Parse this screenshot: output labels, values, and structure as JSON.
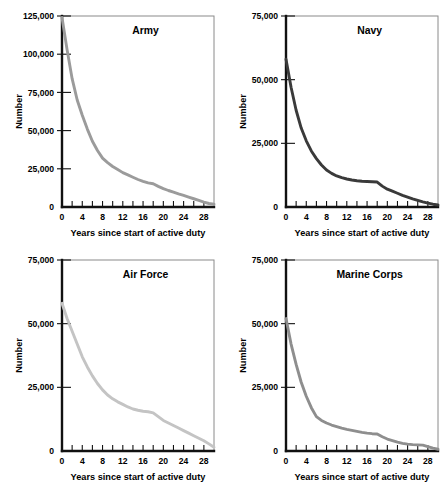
{
  "figure": {
    "name": "military-active-duty-retention-panels",
    "background": "#ffffff",
    "layout": "2x2 grid of small-multiple line charts"
  },
  "chart_data": [
    {
      "type": "line",
      "title": "Army",
      "xlabel": "Years since start of active duty",
      "ylabel": "Number",
      "xlim": [
        0,
        30
      ],
      "ylim": [
        0,
        125000
      ],
      "xticks": [
        0,
        2,
        4,
        6,
        8,
        10,
        12,
        14,
        16,
        18,
        20,
        22,
        24,
        26,
        28
      ],
      "xticklabels": [
        "0",
        "",
        "4",
        "",
        "8",
        "",
        "12",
        "",
        "16",
        "",
        "20",
        "",
        "24",
        "",
        "28"
      ],
      "yticks": [
        0,
        25000,
        50000,
        75000,
        100000,
        125000
      ],
      "yticklabels": [
        "0",
        "25,000",
        "50,000",
        "75,000",
        "100,000",
        "125,000"
      ],
      "grid": false,
      "legend": "none",
      "line_color": "#9b9b9b",
      "x": [
        0,
        1,
        2,
        3,
        4,
        5,
        6,
        7,
        8,
        9,
        10,
        11,
        12,
        13,
        14,
        15,
        16,
        17,
        18,
        19,
        20,
        21,
        22,
        23,
        24,
        25,
        26,
        27,
        28,
        29,
        30
      ],
      "values": [
        124000,
        103000,
        84000,
        70000,
        60000,
        51000,
        43000,
        37000,
        32000,
        29000,
        26500,
        24500,
        22500,
        21000,
        19500,
        18000,
        16800,
        15800,
        15200,
        13500,
        12000,
        10800,
        9700,
        8600,
        7600,
        6500,
        5400,
        4300,
        3200,
        2300,
        1800
      ]
    },
    {
      "type": "line",
      "title": "Navy",
      "xlabel": "Years since start of active duty",
      "ylabel": "Number",
      "xlim": [
        0,
        30
      ],
      "ylim": [
        0,
        75000
      ],
      "xticks": [
        0,
        2,
        4,
        6,
        8,
        10,
        12,
        14,
        16,
        18,
        20,
        22,
        24,
        26,
        28
      ],
      "xticklabels": [
        "0",
        "",
        "4",
        "",
        "8",
        "",
        "12",
        "",
        "16",
        "",
        "20",
        "",
        "24",
        "",
        "28"
      ],
      "yticks": [
        0,
        25000,
        50000,
        75000
      ],
      "yticklabels": [
        "0",
        "25,000",
        "50,000",
        "75,000"
      ],
      "grid": false,
      "legend": "none",
      "line_color": "#3a3a3a",
      "x": [
        0,
        1,
        2,
        3,
        4,
        5,
        6,
        7,
        8,
        9,
        10,
        11,
        12,
        13,
        14,
        15,
        16,
        17,
        18,
        19,
        20,
        21,
        22,
        23,
        24,
        25,
        26,
        27,
        28,
        29,
        30
      ],
      "values": [
        58000,
        47000,
        38000,
        31000,
        26000,
        22000,
        19000,
        16500,
        14500,
        13200,
        12200,
        11500,
        11000,
        10600,
        10300,
        10100,
        10000,
        9900,
        9800,
        8200,
        7000,
        6200,
        5400,
        4600,
        3900,
        3200,
        2600,
        2000,
        1500,
        1100,
        800
      ]
    },
    {
      "type": "line",
      "title": "Air Force",
      "xlabel": "Years since start of active duty",
      "ylabel": "Number",
      "xlim": [
        0,
        30
      ],
      "ylim": [
        0,
        75000
      ],
      "xticks": [
        0,
        2,
        4,
        6,
        8,
        10,
        12,
        14,
        16,
        18,
        20,
        22,
        24,
        26,
        28
      ],
      "xticklabels": [
        "0",
        "",
        "4",
        "",
        "8",
        "",
        "12",
        "",
        "16",
        "",
        "20",
        "",
        "24",
        "",
        "28"
      ],
      "yticks": [
        0,
        25000,
        50000,
        75000
      ],
      "yticklabels": [
        "0",
        "25,000",
        "50,000",
        "75,000"
      ],
      "grid": false,
      "legend": "none",
      "line_color": "#c4c4c4",
      "x": [
        0,
        1,
        2,
        3,
        4,
        5,
        6,
        7,
        8,
        9,
        10,
        11,
        12,
        13,
        14,
        15,
        16,
        17,
        18,
        19,
        20,
        21,
        22,
        23,
        24,
        25,
        26,
        27,
        28,
        29,
        30
      ],
      "values": [
        58000,
        52000,
        47000,
        42000,
        37000,
        33000,
        29500,
        26500,
        24000,
        22000,
        20500,
        19300,
        18300,
        17300,
        16500,
        16000,
        15600,
        15400,
        15000,
        13500,
        12000,
        11000,
        10000,
        9000,
        8000,
        7000,
        6000,
        5000,
        4000,
        2800,
        1500
      ]
    },
    {
      "type": "line",
      "title": "Marine Corps",
      "xlabel": "Years since start of active duty",
      "ylabel": "Number",
      "xlim": [
        0,
        30
      ],
      "ylim": [
        0,
        75000
      ],
      "xticks": [
        0,
        2,
        4,
        6,
        8,
        10,
        12,
        14,
        16,
        18,
        20,
        22,
        24,
        26,
        28
      ],
      "xticklabels": [
        "0",
        "",
        "4",
        "",
        "8",
        "",
        "12",
        "",
        "16",
        "",
        "20",
        "",
        "24",
        "",
        "28"
      ],
      "yticks": [
        0,
        25000,
        50000,
        75000
      ],
      "yticklabels": [
        "0",
        "25,000",
        "50,000",
        "75,000"
      ],
      "grid": false,
      "legend": "none",
      "line_color": "#8e8e8e",
      "x": [
        0,
        1,
        2,
        3,
        4,
        5,
        6,
        7,
        8,
        9,
        10,
        11,
        12,
        13,
        14,
        15,
        16,
        17,
        18,
        19,
        20,
        21,
        22,
        23,
        24,
        25,
        26,
        27,
        28,
        29,
        30
      ],
      "values": [
        52000,
        42000,
        34000,
        27000,
        21500,
        17000,
        13500,
        12000,
        11000,
        10200,
        9600,
        9000,
        8500,
        8100,
        7700,
        7300,
        7000,
        6800,
        6700,
        5600,
        4700,
        4100,
        3500,
        3000,
        2700,
        2500,
        2400,
        2300,
        1700,
        1100,
        700
      ]
    }
  ],
  "panels": [
    {
      "key": "army",
      "title": "Army"
    },
    {
      "key": "navy",
      "title": "Navy"
    },
    {
      "key": "airforce",
      "title": "Air Force"
    },
    {
      "key": "marines",
      "title": "Marine Corps"
    }
  ]
}
